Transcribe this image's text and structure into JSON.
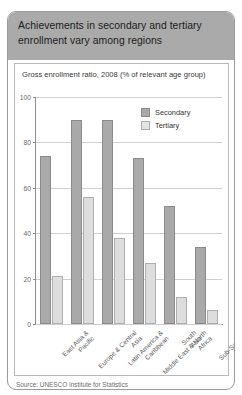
{
  "header": {
    "title": "Achievements in secondary and tertiary enrollment vary among regions"
  },
  "source": {
    "text": "Source: UNESCO Institute for Statistics"
  },
  "chart_data": {
    "type": "bar",
    "title": "Gross enrollment ratio, 2008 (% of relevant age group)",
    "xlabel": "",
    "ylabel": "",
    "ylim": [
      0,
      100
    ],
    "yticks": [
      100,
      80,
      60,
      40,
      20,
      0
    ],
    "grid": true,
    "legend_position": "top-right",
    "categories": [
      "East Asia & Pacific",
      "Europe & Central Asia",
      "Latin America & Caribbean",
      "Middle East & North Africa",
      "South Asia",
      "Sub-Saharan Africa"
    ],
    "series": [
      {
        "name": "Secondary",
        "color": "#a9a9a9",
        "values": [
          74,
          90,
          90,
          73,
          52,
          34
        ]
      },
      {
        "name": "Tertiary",
        "color": "#dddddd",
        "values": [
          21,
          56,
          38,
          27,
          12,
          6
        ]
      }
    ]
  }
}
